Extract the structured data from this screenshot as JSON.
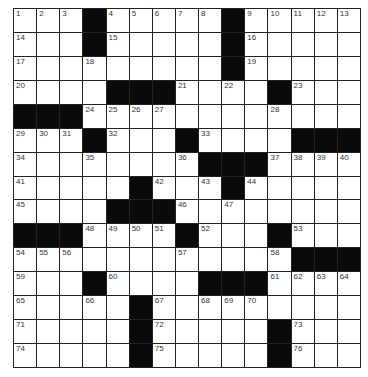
{
  "puzzle": {
    "rows": 15,
    "cols": 15,
    "colors": {
      "block": "#0a0a0a",
      "cell": "#ffffff",
      "line": "#222222",
      "number": "#333333"
    },
    "grid": [
      [
        "1",
        "2",
        "3",
        "#",
        "4",
        "5",
        "6",
        "7",
        "8",
        "#",
        "9",
        "10",
        "11",
        "12",
        "13"
      ],
      [
        "14",
        "",
        "",
        "#",
        "15",
        "",
        "",
        "",
        "",
        "#",
        "16",
        "",
        "",
        "",
        ""
      ],
      [
        "17",
        "",
        "",
        "18",
        "",
        "",
        "",
        "",
        "",
        "#",
        "19",
        "",
        "",
        "",
        ""
      ],
      [
        "20",
        "",
        "",
        "",
        "#",
        "#",
        "#",
        "21",
        "",
        "22",
        "",
        "#",
        "23",
        "",
        ""
      ],
      [
        "#",
        "#",
        "#",
        "24",
        "25",
        "26",
        "27",
        "",
        "",
        "",
        "",
        "28",
        "",
        "",
        ""
      ],
      [
        "29",
        "30",
        "31",
        "#",
        "32",
        "",
        "",
        "#",
        "33",
        "",
        "",
        "",
        "#",
        "#",
        "#"
      ],
      [
        "34",
        "",
        "",
        "35",
        "",
        "",
        "",
        "36",
        "#",
        "#",
        "#",
        "37",
        "38",
        "39",
        "40"
      ],
      [
        "41",
        "",
        "",
        "",
        "",
        "#",
        "42",
        "",
        "43",
        "#",
        "44",
        "",
        "",
        "",
        ""
      ],
      [
        "45",
        "",
        "",
        "",
        "#",
        "#",
        "#",
        "46",
        "",
        "47",
        "",
        "",
        "",
        "",
        ""
      ],
      [
        "#",
        "#",
        "#",
        "48",
        "49",
        "50",
        "51",
        "#",
        "52",
        "",
        "",
        "#",
        "53",
        "",
        ""
      ],
      [
        "54",
        "55",
        "56",
        "",
        "",
        "",
        "",
        "57",
        "",
        "",
        "",
        "58",
        "#",
        "#",
        "#"
      ],
      [
        "59",
        "",
        "",
        "#",
        "60",
        "",
        "",
        "",
        "#",
        "#",
        "#",
        "61",
        "62",
        "63",
        "64"
      ],
      [
        "65",
        "",
        "",
        "66",
        "",
        "#",
        "67",
        "",
        "68",
        "69",
        "70",
        "",
        "",
        "",
        ""
      ],
      [
        "71",
        "",
        "",
        "",
        "",
        "#",
        "72",
        "",
        "",
        "",
        "",
        "#",
        "73",
        "",
        ""
      ],
      [
        "74",
        "",
        "",
        "",
        "",
        "#",
        "75",
        "",
        "",
        "",
        "",
        "#",
        "76",
        "",
        ""
      ]
    ]
  }
}
